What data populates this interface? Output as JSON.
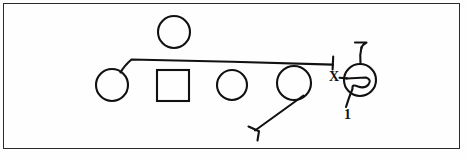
{
  "figure": {
    "background_color": "#fefefe",
    "ink_color": "#111111",
    "frame_color": "#2a2a2a",
    "stroke_width": 2,
    "labels": {
      "x_label": "X",
      "one_label": "1"
    },
    "nodes": [
      {
        "name": "top-circle",
        "shape": "circle",
        "cx": 174,
        "cy": 32,
        "r": 16
      },
      {
        "name": "left-circle",
        "shape": "circle",
        "cx": 112,
        "cy": 85,
        "r": 16
      },
      {
        "name": "square-node",
        "shape": "square",
        "x": 157,
        "y": 70,
        "w": 32,
        "h": 31
      },
      {
        "name": "middle-circle",
        "shape": "circle",
        "cx": 232,
        "cy": 85,
        "r": 15
      },
      {
        "name": "fourth-circle",
        "shape": "circle",
        "cx": 294,
        "cy": 83,
        "r": 17
      },
      {
        "name": "spiral-circle",
        "shape": "circle",
        "cx": 360,
        "cy": 80,
        "r": 16
      }
    ],
    "connectors": [
      {
        "name": "horizontal-beam",
        "from": "left-circle",
        "to": "flag-terminator-right",
        "path": "M 121 72 L 131 59 L 333 64",
        "terminator": "flag"
      },
      {
        "name": "diagonal-branch",
        "from": "fourth-circle",
        "to": "flag-terminator-lower",
        "path": "M 303 96 L 254 130",
        "terminator": "flag"
      },
      {
        "name": "spiral-stem",
        "from": "spiral-circle",
        "to": "flag-terminator-top",
        "path": "M 360 64 L 361 47",
        "terminator": "flag"
      },
      {
        "name": "spiral-tail",
        "from": "spiral-circle",
        "to": "one-label",
        "path": "M 352 91 L 346 107",
        "terminator": "none"
      },
      {
        "name": "x-connector",
        "from": "x-label",
        "to": "spiral-circle",
        "path": "M 340 77 L 360 79",
        "terminator": "none"
      }
    ],
    "annotations": [
      {
        "name": "spiral-glyph",
        "description": "inward spiral inside right circle"
      }
    ]
  }
}
